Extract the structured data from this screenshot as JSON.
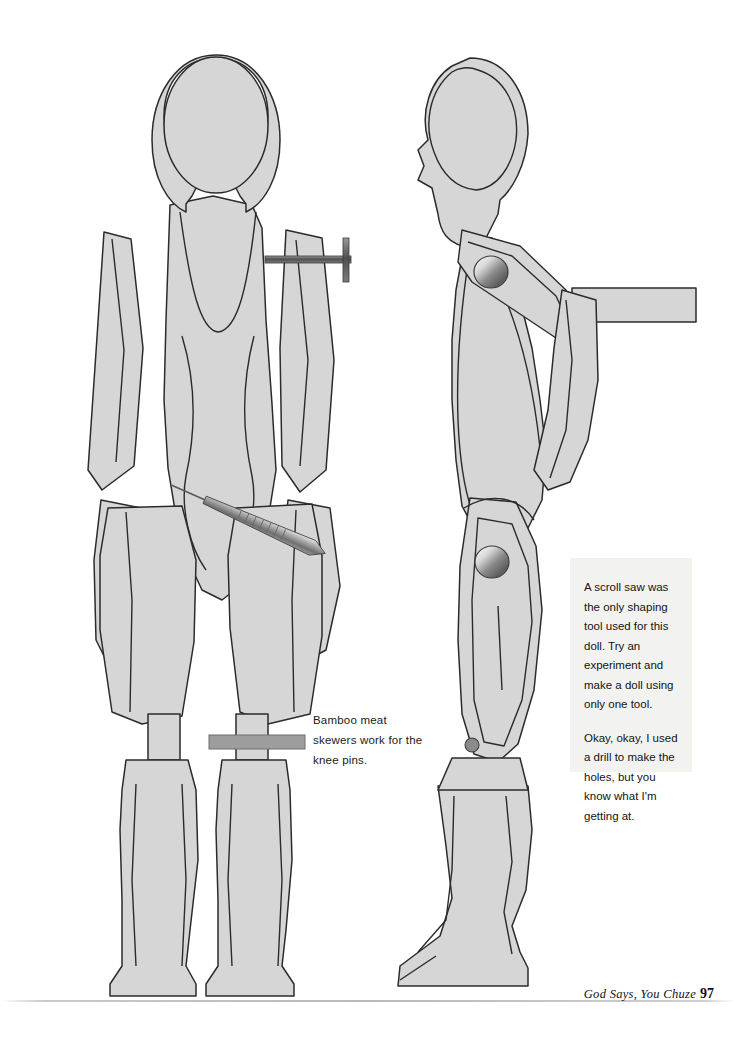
{
  "page": {
    "background_color": "#ffffff"
  },
  "figures": {
    "front_view": {
      "label": "front-view-doll-pattern",
      "description": "Front view of articulated wooden doll showing head, torso, separated arm and leg pieces"
    },
    "side_view": {
      "label": "side-view-doll-pattern",
      "description": "Side profile view of the articulated wooden doll with shoulder and knee pivot pins"
    },
    "colors": {
      "fill": "#d6d6d6",
      "outline": "#2b2b2b",
      "pin_metal_light": "#f4f4f4",
      "pin_metal_dark": "#5a5a5a",
      "skewer": "#8c8c8c"
    },
    "hardware": [
      {
        "name": "shoulder-nail",
        "view": "front",
        "type": "nail-with-flat-head"
      },
      {
        "name": "hip-skewer",
        "view": "front",
        "type": "pointed-wooden-skewer"
      },
      {
        "name": "knee-skewer",
        "view": "front",
        "type": "straight-bamboo-skewer-bar"
      },
      {
        "name": "shoulder-pivot-pin",
        "view": "side",
        "type": "round-metal-rivet"
      },
      {
        "name": "knee-pivot-pin",
        "view": "side",
        "type": "round-metal-rivet"
      },
      {
        "name": "ankle-pin",
        "view": "side",
        "type": "small-round-pin"
      }
    ]
  },
  "callouts": {
    "knee_note": "Bamboo meat skewers work for the knee pins."
  },
  "sidebar": {
    "paragraph_1": "A scroll saw was the only shaping tool used for this doll. Try an experiment and make a doll using only one tool.",
    "paragraph_2": "Okay, okay, I used a drill to make the holes, but you know what I'm getting at.",
    "background_color": "#f2f2f0"
  },
  "footer": {
    "book_title": "God Says, You Chuze",
    "page_number": "97"
  }
}
